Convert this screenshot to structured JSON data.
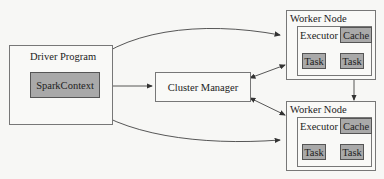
{
  "diagram": {
    "driver": {
      "title": "Driver Program",
      "context": "SparkContext"
    },
    "cluster_manager": {
      "label": "Cluster Manager"
    },
    "workers": [
      {
        "title": "Worker Node",
        "executor": "Executor",
        "cache": "Cache",
        "tasks": [
          "Task",
          "Task"
        ]
      },
      {
        "title": "Worker Node",
        "executor": "Executor",
        "cache": "Cache",
        "tasks": [
          "Task",
          "Task"
        ]
      }
    ],
    "colors": {
      "box_border": "#777777",
      "fill_gray": "#a9a9a9",
      "arrow": "#333333"
    }
  }
}
